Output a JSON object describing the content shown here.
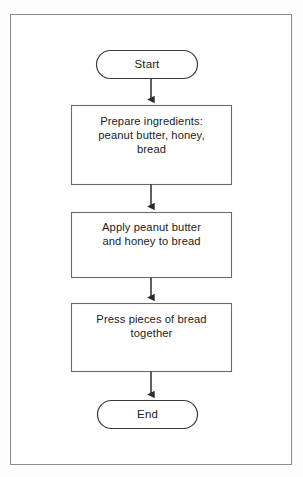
{
  "diagram": {
    "background_color": "#ffffff",
    "frame_border_color": "#8c8c8c",
    "shape_stroke_color": "#3a3a3a",
    "shape_fill_color": "#ffffff",
    "text_color": "#1c1c1c",
    "connector_color": "#2b2b2b",
    "nodes": [
      {
        "id": "start",
        "type": "terminator",
        "shape": "stadium",
        "text": "Start",
        "lines": [
          "Start"
        ]
      },
      {
        "id": "step1",
        "type": "process",
        "shape": "rectangle",
        "text": "Prepare ingredients: peanut butter, honey, bread",
        "lines": [
          "Prepare ingredients:",
          "peanut butter, honey,",
          "bread"
        ]
      },
      {
        "id": "step2",
        "type": "process",
        "shape": "rectangle",
        "text": "Apply peanut butter and honey to bread",
        "lines": [
          "Apply peanut butter",
          "and honey to bread"
        ]
      },
      {
        "id": "step3",
        "type": "process",
        "shape": "rectangle",
        "text": "Press pieces of bread together",
        "lines": [
          "Press pieces of bread",
          "together"
        ]
      },
      {
        "id": "end",
        "type": "terminator",
        "shape": "stadium",
        "text": "End",
        "lines": [
          "End"
        ]
      }
    ],
    "edges": [
      {
        "from": "start",
        "to": "step1",
        "arrow": "down"
      },
      {
        "from": "step1",
        "to": "step2",
        "arrow": "down"
      },
      {
        "from": "step2",
        "to": "step3",
        "arrow": "down"
      },
      {
        "from": "step3",
        "to": "end",
        "arrow": "down"
      }
    ]
  }
}
